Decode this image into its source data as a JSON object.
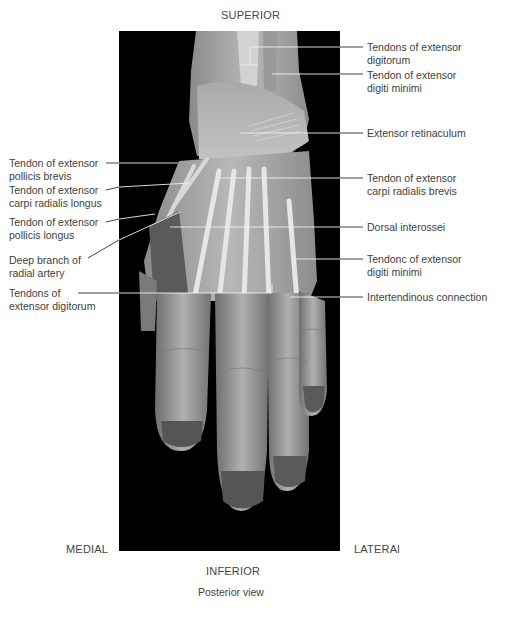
{
  "figure": {
    "orientation": {
      "top": "SUPERIOR",
      "bottom": "INFERIOR",
      "left": "MEDIAL",
      "right": "LATERAl"
    },
    "caption": "Posterior view"
  },
  "labels_right": [
    {
      "id": "tendons-ext-digitorum-top",
      "text": "Tendons of extensor\ndigitorum"
    },
    {
      "id": "tendon-ext-digiti-minimi-top",
      "text": "Tendon of extensor\ndigiti minimi"
    },
    {
      "id": "extensor-retinaculum",
      "text": "Extensor retinaculum"
    },
    {
      "id": "tendon-ecrb",
      "text": "Tendon of extensor\ncarpi radialis brevis"
    },
    {
      "id": "dorsal-interossei",
      "text": "Dorsal interossei"
    },
    {
      "id": "tendons-ext-digiti-minimi-bottom",
      "text": "Tendonc of extensor\ndigiti minimi"
    },
    {
      "id": "intertendinous-connection",
      "text": "Intertendinous connection"
    }
  ],
  "labels_left": [
    {
      "id": "tendon-epb",
      "text": "Tendon of extensor\npollicis brevis"
    },
    {
      "id": "tendon-ecrl",
      "text": "Tendon of extensor\ncarpi radialis longus"
    },
    {
      "id": "tendon-epl",
      "text": "Tendon of extensor\npollicis longus"
    },
    {
      "id": "deep-branch-radial-artery",
      "text": "Deep branch of\nradial artery"
    },
    {
      "id": "tendons-ext-digitorum-bottom",
      "text": "Tendons of\nextensor digitorum"
    }
  ],
  "colors": {
    "background": "#ffffff",
    "photo_bg": "#000000",
    "leader_line": "#2a2a2a",
    "leader_line_on_photo": "#f0f0f0",
    "text": "#3e3e3e"
  }
}
